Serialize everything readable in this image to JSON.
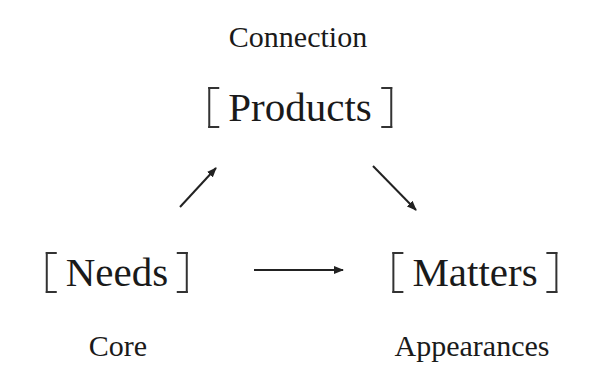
{
  "diagram": {
    "top": {
      "caption": "Connection",
      "node": "Products"
    },
    "left": {
      "node": "Needs",
      "caption": "Core"
    },
    "right": {
      "node": "Matters",
      "caption": "Appearances"
    },
    "edges": [
      {
        "from": "Needs",
        "to": "Products"
      },
      {
        "from": "Products",
        "to": "Matters"
      },
      {
        "from": "Needs",
        "to": "Matters"
      }
    ],
    "colors": {
      "text": "#1a1a1a",
      "lines": "#222222",
      "background": "#ffffff"
    }
  }
}
